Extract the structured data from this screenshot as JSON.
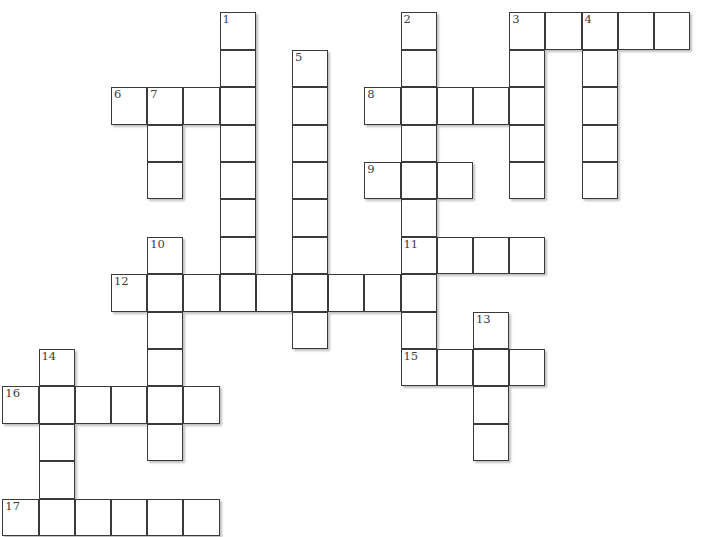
{
  "puzzle": {
    "type": "crossword",
    "cell_width": 36.2,
    "cell_height": 37.4,
    "origin_x": 3,
    "origin_y": 13,
    "colors": {
      "border": "#3a3a3a",
      "number": "#3c3c3c",
      "background": "#ffffff"
    },
    "entries": [
      {
        "number": "1",
        "direction": "down",
        "row": 0,
        "col": 6,
        "length": 8
      },
      {
        "number": "2",
        "direction": "down",
        "row": 0,
        "col": 11,
        "length": 10
      },
      {
        "number": "3",
        "direction": "across",
        "row": 0,
        "col": 14,
        "length": 5
      },
      {
        "number": "3",
        "direction": "down",
        "row": 0,
        "col": 14,
        "length": 5
      },
      {
        "number": "4",
        "direction": "down",
        "row": 0,
        "col": 16,
        "length": 5
      },
      {
        "number": "5",
        "direction": "down",
        "row": 1,
        "col": 8,
        "length": 8
      },
      {
        "number": "6",
        "direction": "across",
        "row": 2,
        "col": 3,
        "length": 4
      },
      {
        "number": "7",
        "direction": "down",
        "row": 2,
        "col": 4,
        "length": 3
      },
      {
        "number": "8",
        "direction": "across",
        "row": 2,
        "col": 10,
        "length": 5
      },
      {
        "number": "9",
        "direction": "across",
        "row": 4,
        "col": 10,
        "length": 3
      },
      {
        "number": "10",
        "direction": "down",
        "row": 6,
        "col": 4,
        "length": 6
      },
      {
        "number": "11",
        "direction": "across",
        "row": 6,
        "col": 11,
        "length": 4
      },
      {
        "number": "12",
        "direction": "across",
        "row": 7,
        "col": 3,
        "length": 9
      },
      {
        "number": "13",
        "direction": "down",
        "row": 8,
        "col": 13,
        "length": 4
      },
      {
        "number": "14",
        "direction": "down",
        "row": 9,
        "col": 1,
        "length": 5
      },
      {
        "number": "15",
        "direction": "across",
        "row": 9,
        "col": 11,
        "length": 4
      },
      {
        "number": "16",
        "direction": "across",
        "row": 10,
        "col": 0,
        "length": 6
      },
      {
        "number": "17",
        "direction": "across",
        "row": 13,
        "col": 0,
        "length": 6
      }
    ]
  }
}
